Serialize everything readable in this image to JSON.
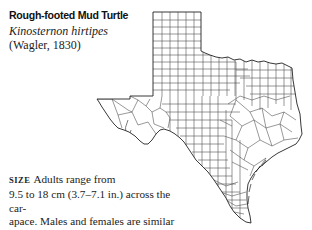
{
  "species": {
    "common_name": "Rough-footed Mud Turtle",
    "scientific_name": "Kinosternon hirtipes",
    "authority": "(Wagler, 1830)"
  },
  "description": {
    "label": "SIZE",
    "line1": "Adults range from",
    "line2": "9.5 to 18 cm (3.7–7.1 in.) across the car-",
    "line3": "apace. Males and females are similar",
    "line4": "in size."
  },
  "map": {
    "region": "Texas",
    "detail": "county boundaries",
    "stroke_color": "#333333"
  }
}
